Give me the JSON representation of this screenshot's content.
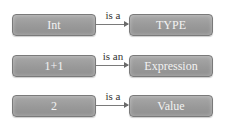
{
  "diagram": {
    "relations": [
      {
        "subject": "Int",
        "relation": "is a",
        "object": "TYPE"
      },
      {
        "subject": "1+1",
        "relation": "is an",
        "object": "Expression"
      },
      {
        "subject": "2",
        "relation": "is a",
        "object": "Value"
      }
    ],
    "colors": {
      "box_fill": "#9a9a9a",
      "box_border": "#7a7a7a",
      "box_text": "#f2f2f2",
      "arrow": "#7a7a7a",
      "label_text": "#333333",
      "background": "#ffffff"
    }
  }
}
